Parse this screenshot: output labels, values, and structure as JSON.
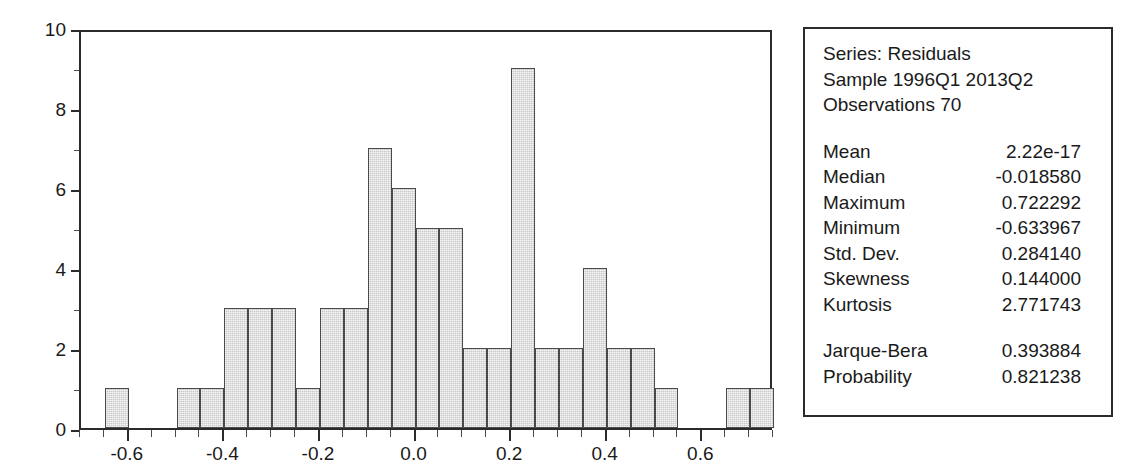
{
  "chart_data": {
    "type": "bar",
    "title": "",
    "subtitle": "",
    "xlabel": "",
    "ylabel": "",
    "xlim": [
      -0.7,
      0.75
    ],
    "ylim": [
      0,
      10
    ],
    "grid": false,
    "legend": "none",
    "bin_width": 0.05,
    "x_tick_labels": [
      "-0.6",
      "-0.4",
      "-0.2",
      "0.0",
      "0.2",
      "0.4",
      "0.6"
    ],
    "x_tick_values": [
      -0.6,
      -0.4,
      -0.2,
      0.0,
      0.2,
      0.4,
      0.6
    ],
    "x_minor_ticks": [
      -0.7,
      -0.65,
      -0.55,
      -0.5,
      -0.45,
      -0.35,
      -0.3,
      -0.25,
      -0.15,
      -0.1,
      -0.05,
      0.05,
      0.1,
      0.15,
      0.25,
      0.3,
      0.35,
      0.45,
      0.5,
      0.55,
      0.65,
      0.7,
      0.75
    ],
    "y_tick_labels": [
      "0",
      "2",
      "4",
      "6",
      "8",
      "10"
    ],
    "y_tick_values": [
      0,
      2,
      4,
      6,
      8,
      10
    ],
    "y_minor_ticks": [
      1,
      3,
      5,
      7,
      9
    ],
    "bins": [
      {
        "left": -0.65,
        "right": -0.6,
        "count": 1
      },
      {
        "left": -0.6,
        "right": -0.55,
        "count": 0
      },
      {
        "left": -0.55,
        "right": -0.5,
        "count": 0
      },
      {
        "left": -0.5,
        "right": -0.45,
        "count": 1
      },
      {
        "left": -0.45,
        "right": -0.4,
        "count": 1
      },
      {
        "left": -0.4,
        "right": -0.35,
        "count": 3
      },
      {
        "left": -0.35,
        "right": -0.3,
        "count": 3
      },
      {
        "left": -0.3,
        "right": -0.25,
        "count": 3
      },
      {
        "left": -0.25,
        "right": -0.2,
        "count": 1
      },
      {
        "left": -0.2,
        "right": -0.15,
        "count": 3
      },
      {
        "left": -0.15,
        "right": -0.1,
        "count": 3
      },
      {
        "left": -0.1,
        "right": -0.05,
        "count": 7
      },
      {
        "left": -0.05,
        "right": 0.0,
        "count": 6
      },
      {
        "left": 0.0,
        "right": 0.05,
        "count": 5
      },
      {
        "left": 0.05,
        "right": 0.1,
        "count": 5
      },
      {
        "left": 0.1,
        "right": 0.15,
        "count": 2
      },
      {
        "left": 0.15,
        "right": 0.2,
        "count": 2
      },
      {
        "left": 0.2,
        "right": 0.25,
        "count": 9
      },
      {
        "left": 0.25,
        "right": 0.3,
        "count": 2
      },
      {
        "left": 0.3,
        "right": 0.35,
        "count": 2
      },
      {
        "left": 0.35,
        "right": 0.4,
        "count": 4
      },
      {
        "left": 0.4,
        "right": 0.45,
        "count": 2
      },
      {
        "left": 0.45,
        "right": 0.5,
        "count": 2
      },
      {
        "left": 0.5,
        "right": 0.55,
        "count": 1
      },
      {
        "left": 0.55,
        "right": 0.6,
        "count": 0
      },
      {
        "left": 0.6,
        "right": 0.65,
        "count": 0
      },
      {
        "left": 0.65,
        "right": 0.7,
        "count": 1
      },
      {
        "left": 0.7,
        "right": 0.75,
        "count": 1
      }
    ],
    "colors": {
      "bar_fill": "#c9c9c9",
      "bar_border": "#4a4a4a",
      "axis": "#2b2b2b",
      "text": "#1a1a1a",
      "background": "#ffffff"
    }
  },
  "stats_box": {
    "header": {
      "series_line": "Series: Residuals",
      "sample_line": "Sample 1996Q1 2013Q2",
      "observations_line": "Observations 70"
    },
    "descriptive": [
      {
        "label": "Mean",
        "value": "2.22e-17"
      },
      {
        "label": "Median",
        "value": "-0.018580"
      },
      {
        "label": "Maximum",
        "value": "0.722292"
      },
      {
        "label": "Minimum",
        "value": "-0.633967"
      },
      {
        "label": "Std. Dev.",
        "value": "0.284140"
      },
      {
        "label": "Skewness",
        "value": "0.144000"
      },
      {
        "label": "Kurtosis",
        "value": "2.771743"
      }
    ],
    "normality": [
      {
        "label": "Jarque-Bera",
        "value": "0.393884"
      },
      {
        "label": "Probability",
        "value": "0.821238"
      }
    ]
  }
}
